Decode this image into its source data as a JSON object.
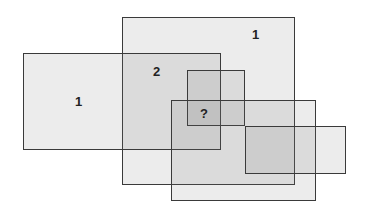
{
  "diagram": {
    "type": "overlapping-rectangles",
    "rectangles": [
      {
        "id": "A",
        "x": 122,
        "y": 17,
        "w": 173,
        "h": 168
      },
      {
        "id": "B",
        "x": 23,
        "y": 53,
        "w": 198,
        "h": 97
      },
      {
        "id": "C",
        "x": 187,
        "y": 70,
        "w": 58,
        "h": 56
      },
      {
        "id": "D",
        "x": 171,
        "y": 100,
        "w": 145,
        "h": 101
      },
      {
        "id": "E",
        "x": 245,
        "y": 126,
        "w": 101,
        "h": 48
      }
    ],
    "labels": [
      {
        "text": "1",
        "x": 252,
        "y": 28
      },
      {
        "text": "1",
        "x": 75,
        "y": 95
      },
      {
        "text": "2",
        "x": 153,
        "y": 65
      },
      {
        "text": "?",
        "x": 200,
        "y": 107
      }
    ]
  }
}
